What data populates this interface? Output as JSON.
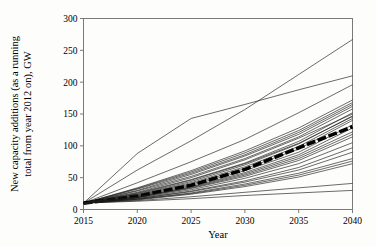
{
  "chart_data": {
    "type": "line",
    "title": "",
    "xlabel": "Year",
    "ylabel": "New capacity additions (as a running total from year 2012 on), GW",
    "xlim": [
      2015,
      2040
    ],
    "ylim": [
      0,
      300
    ],
    "xticks": [
      2015,
      2020,
      2025,
      2030,
      2035,
      2040
    ],
    "yticks": [
      0,
      50,
      100,
      150,
      200,
      250,
      300
    ],
    "grid": false,
    "legend": "none",
    "x": [
      2015,
      2020,
      2025,
      2030,
      2035,
      2040
    ],
    "series": [
      {
        "name": "scenario-01-high-outlier",
        "emphasis": "thin",
        "values": [
          10,
          88,
          143,
          165,
          188,
          210
        ]
      },
      {
        "name": "scenario-02-high-outlier",
        "emphasis": "thin",
        "values": [
          10,
          62,
          108,
          157,
          212,
          267
        ]
      },
      {
        "name": "scenario-03",
        "emphasis": "thin",
        "values": [
          10,
          42,
          75,
          110,
          152,
          196
        ]
      },
      {
        "name": "scenario-04",
        "emphasis": "thin",
        "values": [
          10,
          34,
          61,
          92,
          128,
          172
        ]
      },
      {
        "name": "scenario-05",
        "emphasis": "thin",
        "values": [
          10,
          33,
          59,
          89,
          124,
          168
        ]
      },
      {
        "name": "scenario-06",
        "emphasis": "thin",
        "values": [
          10,
          32,
          57,
          86,
          121,
          165
        ]
      },
      {
        "name": "scenario-07",
        "emphasis": "thin",
        "values": [
          10,
          30,
          55,
          84,
          118,
          162
        ]
      },
      {
        "name": "scenario-08",
        "emphasis": "thin",
        "values": [
          10,
          29,
          52,
          80,
          114,
          158
        ]
      },
      {
        "name": "scenario-09",
        "emphasis": "thin",
        "values": [
          10,
          26,
          47,
          73,
          107,
          152
        ]
      },
      {
        "name": "scenario-10",
        "emphasis": "thin",
        "values": [
          10,
          24,
          44,
          70,
          103,
          147
        ]
      },
      {
        "name": "scenario-11",
        "emphasis": "thin",
        "values": [
          10,
          22,
          40,
          64,
          95,
          140
        ]
      },
      {
        "name": "scenario-12",
        "emphasis": "thin",
        "values": [
          10,
          21,
          38,
          61,
          90,
          133
        ]
      },
      {
        "name": "scenario-13",
        "emphasis": "thin",
        "values": [
          10,
          20,
          36,
          58,
          86,
          128
        ]
      },
      {
        "name": "scenario-14-median",
        "emphasis": "bold-dashed",
        "values": [
          10,
          21,
          38,
          63,
          97,
          130
        ]
      },
      {
        "name": "scenario-15",
        "emphasis": "thin",
        "values": [
          10,
          20,
          35,
          56,
          83,
          122
        ]
      },
      {
        "name": "scenario-16",
        "emphasis": "thin",
        "values": [
          10,
          19,
          34,
          54,
          80,
          118
        ]
      },
      {
        "name": "scenario-17",
        "emphasis": "thin",
        "values": [
          10,
          19,
          33,
          52,
          77,
          114
        ]
      },
      {
        "name": "scenario-18",
        "emphasis": "thin",
        "values": [
          10,
          18,
          31,
          49,
          72,
          105
        ]
      },
      {
        "name": "scenario-19",
        "emphasis": "thin",
        "values": [
          10,
          17,
          29,
          45,
          66,
          97
        ]
      },
      {
        "name": "scenario-20",
        "emphasis": "thin",
        "values": [
          10,
          17,
          28,
          43,
          62,
          90
        ]
      },
      {
        "name": "scenario-21",
        "emphasis": "thin",
        "values": [
          10,
          16,
          26,
          40,
          57,
          80
        ]
      },
      {
        "name": "scenario-22",
        "emphasis": "thin",
        "values": [
          10,
          16,
          25,
          38,
          54,
          76
        ]
      },
      {
        "name": "scenario-23",
        "emphasis": "thin",
        "values": [
          10,
          15,
          24,
          36,
          51,
          72
        ]
      },
      {
        "name": "scenario-24",
        "emphasis": "thin",
        "values": [
          10,
          14,
          20,
          27,
          34,
          41
        ]
      },
      {
        "name": "scenario-25",
        "emphasis": "thin",
        "values": [
          10,
          13,
          17,
          22,
          26,
          30
        ]
      },
      {
        "name": "scenario-26",
        "emphasis": "thin",
        "values": [
          10,
          27,
          50,
          78,
          112,
          150
        ]
      },
      {
        "name": "scenario-27",
        "emphasis": "thin",
        "values": [
          10,
          23,
          42,
          67,
          99,
          143
        ]
      },
      {
        "name": "scenario-28",
        "emphasis": "thin",
        "values": [
          10,
          25,
          46,
          72,
          104,
          146
        ]
      }
    ]
  },
  "axes": {
    "x_tick_labels": [
      "2015",
      "2020",
      "2025",
      "2030",
      "2035",
      "2040"
    ],
    "y_tick_labels": [
      "0",
      "50",
      "100",
      "150",
      "200",
      "250",
      "300"
    ],
    "x_axis_title": "Year",
    "y_axis_title": "New capacity additions (as a running total from year 2012 on), GW"
  },
  "style": {
    "line_color": "#1a1a1a",
    "median_color": "#000000",
    "axis_color": "#7a7a7a",
    "background": "#fdfdfc"
  }
}
